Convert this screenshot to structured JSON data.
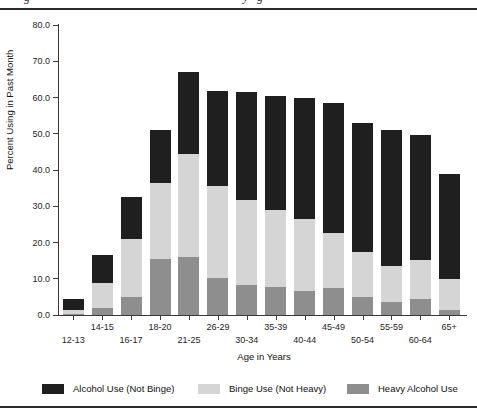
{
  "page": {
    "caption_fragments": [
      {
        "glyph": "g",
        "x": 24
      },
      {
        "glyph": "y",
        "x": 243
      },
      {
        "glyph": "g",
        "x": 257
      }
    ]
  },
  "chart_data": {
    "type": "stacked-bar",
    "title": "",
    "xlabel": "Age in Years",
    "ylabel": "Percent Using in Past Month",
    "ylim": [
      0,
      80
    ],
    "yticks": [
      0,
      10,
      20,
      30,
      40,
      50,
      60,
      70,
      80
    ],
    "ytick_labels": [
      "0.0",
      "10.0",
      "20.0",
      "30.0",
      "40.0",
      "50.0",
      "60.0",
      "70.0",
      "80.0"
    ],
    "categories": [
      "12-13",
      "14-15",
      "16-17",
      "18-20",
      "21-25",
      "26-29",
      "30-34",
      "35-39",
      "40-44",
      "45-49",
      "50-54",
      "55-59",
      "60-64",
      "65+"
    ],
    "series": [
      {
        "name": "Heavy Alcohol Use",
        "color": "#8e8e8e",
        "values": [
          0.3,
          2.0,
          5.0,
          15.5,
          16.0,
          10.2,
          8.2,
          7.7,
          6.5,
          7.5,
          5.1,
          3.5,
          4.3,
          1.5
        ]
      },
      {
        "name": "Binge Use (Not Heavy)",
        "color": "#d5d5d5",
        "values": [
          1.2,
          6.8,
          16.0,
          21.0,
          28.3,
          25.3,
          23.5,
          21.2,
          20.0,
          15.0,
          12.3,
          9.9,
          11.0,
          8.3
        ]
      },
      {
        "name": "Alcohol Use (Not Binge)",
        "color": "#1f1f1f",
        "values": [
          2.8,
          7.7,
          11.6,
          14.5,
          22.7,
          26.2,
          29.8,
          31.4,
          33.5,
          36.0,
          35.5,
          37.6,
          34.3,
          29.1
        ]
      }
    ],
    "totals": [
      4.3,
      16.5,
      32.6,
      51.0,
      67.0,
      61.7,
      61.5,
      60.3,
      60.0,
      58.5,
      52.9,
      51.0,
      49.6,
      38.9
    ],
    "grid": false,
    "legend_position": "bottom"
  },
  "legend": {
    "items": [
      {
        "label": "Alcohol Use (Not Binge)",
        "color": "#1f1f1f"
      },
      {
        "label": "Binge Use (Not Heavy)",
        "color": "#d5d5d5"
      },
      {
        "label": "Heavy Alcohol Use",
        "color": "#8e8e8e"
      }
    ]
  }
}
